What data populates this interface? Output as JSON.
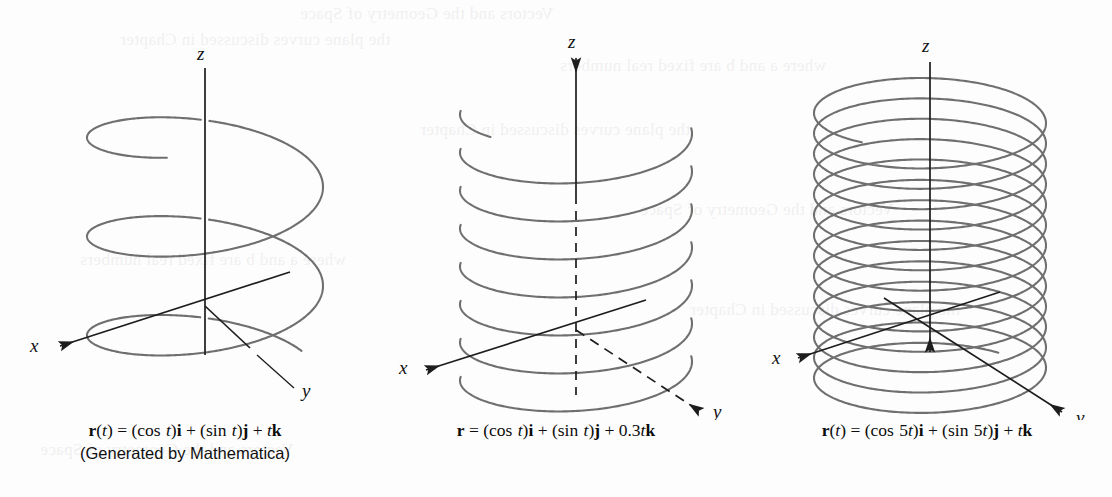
{
  "page": {
    "background_color": "#fdfdfd",
    "curve_color": "#6f6f6f",
    "axis_color": "#1d1d1d",
    "text_color": "#0c0c0c",
    "width": 1112,
    "height": 497
  },
  "ghost_text": {
    "description": "faint show-through text from the reverse side of the printed page",
    "lines": [
      "Vectors and the Geometry of Space",
      "the plane curves discussed in Chapter",
      "where a and b are fixed real numbers"
    ]
  },
  "figures": [
    {
      "id": "helix-standard",
      "axis_labels": {
        "x": "x",
        "y": "y",
        "z": "z"
      },
      "z_axis_arrow": false,
      "y_axis_dashed": false,
      "z_axis_dashed_below_origin": false,
      "turns": 2.6,
      "caption_lines": [
        "r(t) = (cos t)i + (sin t)j + tk",
        "(Generated by Mathematica)"
      ],
      "caption_html": [
        "<span class=\"mbold\">r</span>(<span class=\"mvar\">t</span>) = (<span class=\"mop\">cos</span> <span class=\"mvar\">t</span>)<span class=\"mbold\">i</span> + (<span class=\"mop\">sin</span> <span class=\"mvar\">t</span>)<span class=\"mbold\">j</span> + <span class=\"mvar\">t</span><span class=\"mbold\">k</span>",
        "(Generated by Mathematica)"
      ],
      "curve_data": {
        "x_expr": "cos t",
        "y_expr": "sin t",
        "z_expr": "t",
        "pitch_factor": 1.0,
        "angular_frequency": 1
      }
    },
    {
      "id": "helix-slow-rise",
      "axis_labels": {
        "x": "x",
        "y": "y",
        "z": "z"
      },
      "z_axis_arrow": true,
      "y_axis_dashed": true,
      "z_axis_dashed_below_origin": true,
      "turns": 7.5,
      "caption_lines": [
        "r = (cos t)i + (sin t)j + 0.3tk"
      ],
      "caption_html": [
        "<span class=\"mbold\">r</span> = (<span class=\"mop\">cos</span> <span class=\"mvar\">t</span>)<span class=\"mbold\">i</span> + (<span class=\"mop\">sin</span> <span class=\"mvar\">t</span>)<span class=\"mbold\">j</span> + 0.3<span class=\"mvar\">t</span><span class=\"mbold\">k</span>"
      ],
      "curve_data": {
        "x_expr": "cos t",
        "y_expr": "sin t",
        "z_expr": "0.3t",
        "pitch_factor": 0.3,
        "angular_frequency": 1
      }
    },
    {
      "id": "helix-fast-spin",
      "axis_labels": {
        "x": "x",
        "y": "y",
        "z": "z"
      },
      "z_axis_arrow": true,
      "y_axis_dashed": false,
      "z_axis_dashed_below_origin": false,
      "turns": 13.5,
      "caption_lines": [
        "r(t) = (cos 5t)i + (sin 5t)j + tk"
      ],
      "caption_html": [
        "<span class=\"mbold\">r</span>(<span class=\"mvar\">t</span>) = (<span class=\"mop\">cos</span> 5<span class=\"mvar\">t</span>)<span class=\"mbold\">i</span> + (<span class=\"mop\">sin</span> 5<span class=\"mvar\">t</span>)<span class=\"mbold\">j</span> + <span class=\"mvar\">t</span><span class=\"mbold\">k</span>"
      ],
      "curve_data": {
        "x_expr": "cos 5t",
        "y_expr": "sin 5t",
        "z_expr": "t",
        "pitch_factor": 0.2,
        "angular_frequency": 5
      }
    }
  ],
  "geometry": {
    "helix_standard": {
      "cx": 205,
      "cy": 245,
      "rx": 118,
      "ry": 42,
      "top": 118,
      "bottom": 375,
      "turns": 2.6,
      "phase": 1.9,
      "origin": {
        "x": 205,
        "y": 306
      },
      "x_axis": {
        "x1": 290,
        "y1": 272,
        "x2": 60,
        "y2": 346
      },
      "z_axis": {
        "x1": 205,
        "y1": 68,
        "x2": 205,
        "y2": 355
      },
      "y_axis": {
        "x1": 205,
        "y1": 306,
        "x2": 250,
        "y2": 348
      },
      "y_leader": {
        "x1": 257,
        "y1": 355,
        "x2": 294,
        "y2": 388
      },
      "label_x": {
        "x": 30,
        "y": 352
      },
      "label_y": {
        "x": 302,
        "y": 397
      },
      "label_z": {
        "x": 197,
        "y": 60
      }
    },
    "helix_slow": {
      "cx": 575,
      "cy": 240,
      "rx": 116,
      "ry": 40,
      "top": 110,
      "bottom": 395,
      "turns": 7.5,
      "phase": 2.4,
      "origin": {
        "x": 575,
        "y": 330
      },
      "x_axis": {
        "x1": 645,
        "y1": 300,
        "x2": 425,
        "y2": 370
      },
      "z_axis": {
        "x1": 575,
        "y1": 58,
        "x2": 575,
        "y2": 395
      },
      "y_axis": {
        "x1": 575,
        "y1": 330,
        "x2": 700,
        "y2": 412
      },
      "label_x": {
        "x": 398,
        "y": 374
      },
      "label_y": {
        "x": 712,
        "y": 418
      },
      "label_z": {
        "x": 567,
        "y": 48
      }
    },
    "helix_fast": {
      "cx": 930,
      "cy": 240,
      "rx": 116,
      "ry": 40,
      "top": 110,
      "bottom": 385,
      "turns": 13.5,
      "phase": 2.2,
      "origin": {
        "x": 930,
        "y": 320
      },
      "x_axis": {
        "x1": 1000,
        "y1": 292,
        "x2": 798,
        "y2": 358
      },
      "z_axis": {
        "x1": 930,
        "y1": 62,
        "x2": 930,
        "y2": 352
      },
      "y_axis": {
        "x1": 884,
        "y1": 298,
        "x2": 1062,
        "y2": 412
      },
      "label_x": {
        "x": 772,
        "y": 364
      },
      "label_y": {
        "x": 1076,
        "y": 424
      },
      "label_z": {
        "x": 922,
        "y": 52
      }
    }
  }
}
